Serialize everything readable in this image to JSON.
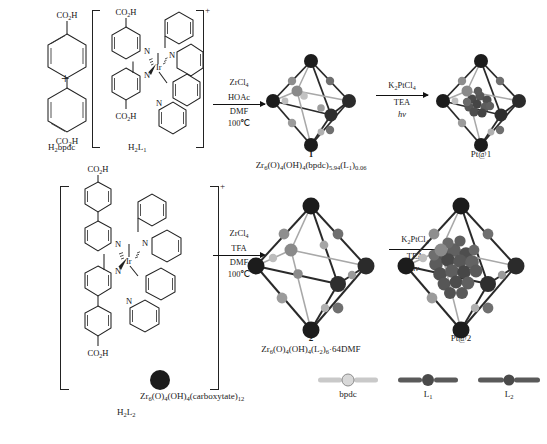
{
  "scheme": {
    "title": "Synthesis of Zr-MOFs 1 and 2 from Ir photosensitizer linkers and Pt nanoparticle loading",
    "row1": {
      "reactant_a": {
        "name": "H2bpdc",
        "label_html": "H<sub>2</sub>bpdc",
        "top_group": "CO2H",
        "bottom_group": "CO2H"
      },
      "plus": "+",
      "reactant_b": {
        "name": "H2L1",
        "label_html": "H<sub>2</sub>L<sub>1</sub>",
        "charge": "+",
        "metal": "Ir",
        "donors": [
          "N",
          "N",
          "N",
          "N"
        ],
        "top_group": "CO2H",
        "bottom_group": "CO2H"
      },
      "arrow1": {
        "reagent1": "ZrCl4",
        "reagent2": "HOAc",
        "solvent": "DMF",
        "temperature": "100℃"
      },
      "product": {
        "number": "1",
        "formula_html": "Zr<sub>6</sub>(O)<sub>4</sub>(OH)<sub>4</sub>(bpdc)<sub>5.94</sub>(L<sub>1</sub>)<sub>0.06</sub>"
      },
      "arrow2": {
        "reagent1": "K2PtCl4",
        "reagent2": "TEA",
        "condition": "hv"
      },
      "final": {
        "label": "Pt@1"
      }
    },
    "row2": {
      "reactant": {
        "name": "H2L2",
        "label_html": "H<sub>2</sub>L<sub>2</sub>",
        "charge": "+",
        "metal": "Ir",
        "donors": [
          "N",
          "N",
          "N",
          "N"
        ],
        "top_group": "CO2H",
        "bottom_group": "CO2H"
      },
      "arrow1": {
        "reagent1": "ZrCl4",
        "reagent2": "TFA",
        "solvent": "DMF",
        "temperature": "100℃"
      },
      "product": {
        "number": "2",
        "formula_html": "Zr<sub>6</sub>(O)<sub>4</sub>(OH)<sub>4</sub>(L<sub>2</sub>)<sub>6</sub>·64DMF"
      },
      "arrow2": {
        "reagent1": "K2PtCl4",
        "reagent2": "TEA",
        "condition": "hv"
      },
      "final": {
        "label": "Pt@2"
      }
    },
    "legend": {
      "items": [
        {
          "key": "node",
          "label_html": "Zr<sub>6</sub>(O)<sub>4</sub>(OH)<sub>4</sub>(carboxytate)<sub>12</sub>",
          "glyph": "filled-sphere"
        },
        {
          "key": "bpdc",
          "label_html": "bpdc",
          "glyph": "light-rod"
        },
        {
          "key": "L1",
          "label_html": "L<sub>1</sub>",
          "glyph": "dark-rod"
        },
        {
          "key": "L2",
          "label_html": "L<sub>2</sub>",
          "glyph": "dark-rod-long"
        }
      ]
    },
    "colors": {
      "node_dark": "#1c1c1c",
      "node_mid": "#6d6d6d",
      "node_light": "#b9b9b9",
      "rod_light": "#c9c9c9",
      "rod_dark": "#5a5a5a",
      "nanoparticle": "#4a4a4a",
      "line": "#222222",
      "background": "#ffffff"
    }
  },
  "chart_data": {
    "type": "diagram",
    "nodes": [
      {
        "id": "H2bpdc",
        "kind": "molecule",
        "label": "H2bpdc"
      },
      {
        "id": "H2L1",
        "kind": "molecule",
        "label": "H2L1"
      },
      {
        "id": "1",
        "kind": "mof",
        "label": "1"
      },
      {
        "id": "Pt@1",
        "kind": "mof",
        "label": "Pt@1"
      },
      {
        "id": "H2L2",
        "kind": "molecule",
        "label": "H2L2"
      },
      {
        "id": "2",
        "kind": "mof",
        "label": "2"
      },
      {
        "id": "Pt@2",
        "kind": "mof",
        "label": "Pt@2"
      }
    ],
    "edges": [
      {
        "from": "H2bpdc + H2L1",
        "to": "1",
        "conditions": [
          "ZrCl4",
          "HOAc",
          "DMF",
          "100℃"
        ]
      },
      {
        "from": "1",
        "to": "Pt@1",
        "conditions": [
          "K2PtCl4",
          "TEA",
          "hv"
        ]
      },
      {
        "from": "H2L2",
        "to": "2",
        "conditions": [
          "ZrCl4",
          "TFA",
          "DMF",
          "100℃"
        ]
      },
      {
        "from": "2",
        "to": "Pt@2",
        "conditions": [
          "K2PtCl4",
          "TEA",
          "hv"
        ]
      }
    ]
  }
}
